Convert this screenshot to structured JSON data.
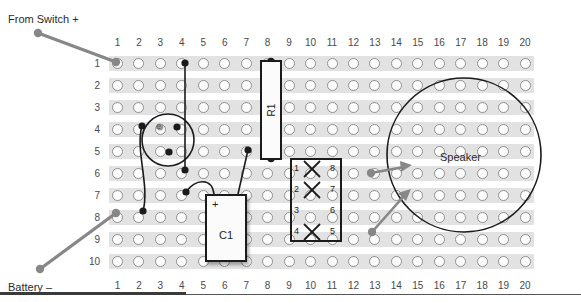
{
  "breadboard": {
    "columns": [
      "1",
      "2",
      "3",
      "4",
      "5",
      "6",
      "7",
      "8",
      "9",
      "10",
      "11",
      "12",
      "13",
      "14",
      "15",
      "16",
      "17",
      "18",
      "19",
      "20"
    ],
    "rows": [
      "1",
      "2",
      "3",
      "4",
      "5",
      "6",
      "7",
      "8",
      "9",
      "10"
    ],
    "grid": {
      "cols": 20,
      "rows": 10
    },
    "hole_color": "#fdfdfd",
    "strip_color": "#e2e2e2"
  },
  "annotations": [
    {
      "id": "from-switch",
      "text": "From Switch +",
      "x": 8,
      "y": 14
    },
    {
      "id": "battery-neg",
      "text": "Battery –",
      "x": 8,
      "y": 282
    }
  ],
  "components": {
    "resistor": {
      "name": "R1",
      "label": "R1",
      "column": 8,
      "row_start": 1,
      "row_end": 5
    },
    "capacitor": {
      "name": "C1",
      "label": "C1",
      "polarity": "+",
      "column_start": 5,
      "column_end": 7
    },
    "ic": {
      "name": "IC socket",
      "pins_left": [
        "1",
        "2",
        "3",
        "4"
      ],
      "pins_right": [
        "8",
        "7",
        "6",
        "5"
      ],
      "crossed_pins": [
        "1",
        "2",
        "4"
      ]
    },
    "transistor": {
      "name": "transistor",
      "lead_label": "e"
    },
    "speaker": {
      "label": "Speaker"
    }
  },
  "colors": {
    "wire_black": "#1b1b1b",
    "wire_gray": "#878787",
    "outline": "#1b1b1b",
    "text": "#2a2a2a"
  }
}
